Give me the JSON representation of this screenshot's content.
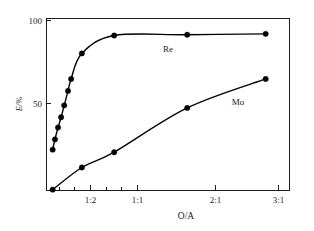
{
  "chart_data": {
    "type": "line",
    "title": "",
    "subtitle": "",
    "xlabel": "O/A",
    "ylabel": "E/%",
    "grid": false,
    "legend_position": "inline-annotation",
    "x_tick_labels": [
      "1:2",
      "1:1",
      "2:1",
      "3:1"
    ],
    "x_tick_values": [
      0.5,
      1.0,
      2.0,
      3.0
    ],
    "y_tick_labels": [
      "50",
      "100"
    ],
    "y_tick_values": [
      50,
      100
    ],
    "xlim": [
      0.12,
      3.28
    ],
    "ylim": [
      0,
      101
    ],
    "series": [
      {
        "name": "Re",
        "label": "Re",
        "marker": "filled-circle",
        "color": "#000000",
        "x": [
          0.2,
          0.23,
          0.27,
          0.31,
          0.35,
          0.4,
          0.44,
          0.58,
          1.0,
          1.95,
          2.97
        ],
        "y": [
          24.0,
          30.0,
          37.0,
          43.0,
          50.0,
          58.5,
          65.5,
          80.5,
          91.0,
          91.5,
          92.0
        ]
      },
      {
        "name": "Mo",
        "label": "Mo",
        "marker": "filled-circle",
        "color": "#000000",
        "x": [
          0.2,
          0.58,
          1.0,
          1.95,
          2.97
        ],
        "y": [
          0.5,
          13.5,
          22.5,
          48.5,
          65.5
        ]
      }
    ],
    "annotations": [
      {
        "text": "Re",
        "x": 1.22,
        "y": 78.0
      },
      {
        "text": "Mo",
        "x": 2.35,
        "y": 57.0
      }
    ]
  }
}
